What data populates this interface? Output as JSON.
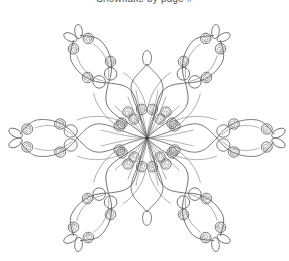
{
  "page": {
    "caption": "Snowflake by page #",
    "background": "#ffffff",
    "line_color": "#4a4a4a"
  },
  "snowflake": {
    "type": "quilled-snowflake-coloring-outline",
    "arms": 6,
    "center": [
      147,
      138
    ],
    "arm_types": [
      "vertical-short",
      "diagonal-ornate",
      "horizontal-ornate"
    ],
    "elements_per_arm": [
      "center-petal",
      "tear-drop-oval",
      "open-circles",
      "spiral-coils",
      "swirl-loops"
    ]
  }
}
